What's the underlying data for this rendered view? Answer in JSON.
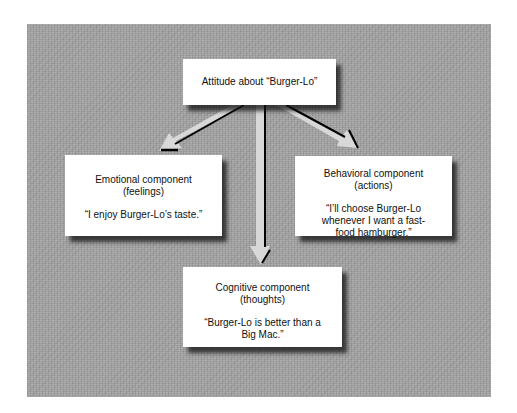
{
  "diagram": {
    "root": {
      "label": "Attitude about “Burger-Lo”"
    },
    "components": [
      {
        "id": "emotional",
        "title": "Emotional component",
        "subtitle": "(feelings)",
        "quote": "“I enjoy Burger-Lo’s taste.”"
      },
      {
        "id": "behavioral",
        "title": "Behavioral component",
        "subtitle": "(actions)",
        "quote": "“I’ll choose Burger-Lo whenever I want a fast-food hamburger.”"
      },
      {
        "id": "cognitive",
        "title": "Cognitive component",
        "subtitle": "(thoughts)",
        "quote": "“Burger-Lo is better than a Big Mac.”"
      }
    ],
    "edges": [
      {
        "from": "root",
        "to": "emotional"
      },
      {
        "from": "root",
        "to": "cognitive"
      },
      {
        "from": "root",
        "to": "behavioral"
      }
    ],
    "colors": {
      "panel_background": "#a3a3a3",
      "box_fill": "#ffffff",
      "arrow_fill": "#d8d8d8",
      "arrow_shadow": "#000000"
    }
  }
}
